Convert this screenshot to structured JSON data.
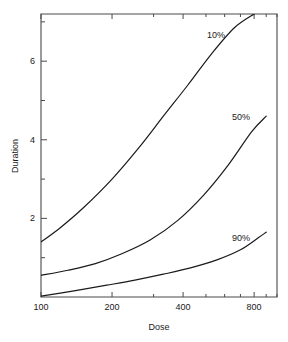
{
  "chart_data": {
    "type": "line",
    "title": "",
    "xlabel": "Dose",
    "ylabel": "Duration",
    "xscale": "log",
    "yscale": "linear",
    "xlim": [
      100,
      1000
    ],
    "ylim": [
      0,
      7.2
    ],
    "grid": false,
    "legend_position": "inline-right-of-curve-end",
    "x_major_ticks": [
      100,
      200,
      400,
      800
    ],
    "x_major_tick_labels": [
      "100",
      "200",
      "400",
      "800"
    ],
    "x_minor_ticks": [
      300,
      500,
      600,
      700,
      900,
      1000
    ],
    "y_major_ticks": [
      2,
      4,
      6
    ],
    "y_major_tick_labels": [
      "2",
      "4",
      "6"
    ],
    "y_minor_ticks": [
      1,
      3,
      5,
      7
    ],
    "series": [
      {
        "name": "10%",
        "label": "10%",
        "color": "#1a1a1a",
        "x": [
          100,
          120,
          150,
          200,
          260,
          330,
          420,
          530,
          660,
          800
        ],
        "values": [
          1.4,
          1.75,
          2.25,
          3.0,
          3.8,
          4.6,
          5.4,
          6.2,
          6.85,
          7.2
        ]
      },
      {
        "name": "50%",
        "label": "50%",
        "color": "#1a1a1a",
        "x": [
          100,
          130,
          170,
          220,
          290,
          380,
          490,
          620,
          780,
          900
        ],
        "values": [
          0.55,
          0.68,
          0.85,
          1.1,
          1.45,
          1.95,
          2.6,
          3.35,
          4.2,
          4.6
        ]
      },
      {
        "name": "90%",
        "label": "90%",
        "color": "#1a1a1a",
        "x": [
          100,
          140,
          190,
          250,
          330,
          430,
          560,
          700,
          830,
          900
        ],
        "values": [
          0.02,
          0.16,
          0.3,
          0.43,
          0.58,
          0.74,
          0.95,
          1.2,
          1.5,
          1.65
        ]
      }
    ]
  },
  "axes": {
    "x_title": "Dose",
    "y_title": "Duration"
  }
}
